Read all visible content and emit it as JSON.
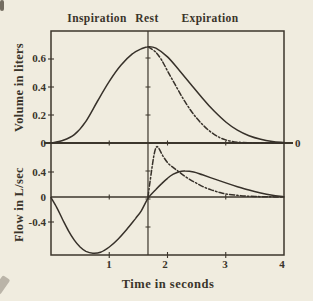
{
  "figure": {
    "phase_labels": [
      "Inspiration",
      "Rest",
      "Expiration"
    ],
    "volume_axis": {
      "label": "Volume in liters",
      "ticks": [
        "0.6",
        "0.4",
        "0.2",
        "0"
      ]
    },
    "flow_axis": {
      "label": "Flow in L/sec",
      "ticks": [
        "0.4",
        "0",
        "-0.4"
      ]
    },
    "right_zero_label": "0",
    "x_axis": {
      "label": "Time in seconds",
      "ticks": [
        "1",
        "2",
        "3",
        "4"
      ]
    }
  },
  "chart_data": [
    {
      "id": "volume",
      "type": "line",
      "ylabel": "Volume in liters",
      "xlabel": "Time in seconds",
      "xlim": [
        0,
        4
      ],
      "ylim": [
        0,
        0.8
      ],
      "ytick_values": [
        0,
        0.2,
        0.4,
        0.6
      ],
      "zero_line_tick_times": [
        1,
        2,
        3
      ],
      "annotations": [
        "Inspiration",
        "Rest",
        "Expiration"
      ],
      "rest_line_x": 1.665,
      "series": [
        {
          "name": "solid",
          "style": "solid",
          "points": [
            [
              0,
              0
            ],
            [
              0.2,
              0.018
            ],
            [
              0.4,
              0.06
            ],
            [
              0.6,
              0.155
            ],
            [
              0.8,
              0.3
            ],
            [
              1.0,
              0.44
            ],
            [
              1.2,
              0.555
            ],
            [
              1.4,
              0.638
            ],
            [
              1.55,
              0.672
            ],
            [
              1.665,
              0.688
            ],
            [
              1.8,
              0.678
            ],
            [
              2.0,
              0.615
            ],
            [
              2.2,
              0.52
            ],
            [
              2.4,
              0.42
            ],
            [
              2.6,
              0.32
            ],
            [
              2.8,
              0.228
            ],
            [
              3.0,
              0.15
            ],
            [
              3.2,
              0.092
            ],
            [
              3.4,
              0.052
            ],
            [
              3.6,
              0.027
            ],
            [
              3.8,
              0.011
            ],
            [
              4.0,
              0.003
            ]
          ]
        },
        {
          "name": "dashed",
          "style": "dashdot",
          "points": [
            [
              1.665,
              0.688
            ],
            [
              1.8,
              0.648
            ],
            [
              1.9,
              0.592
            ],
            [
              2.0,
              0.515
            ],
            [
              2.1,
              0.44
            ],
            [
              2.2,
              0.365
            ],
            [
              2.3,
              0.295
            ],
            [
              2.4,
              0.232
            ],
            [
              2.5,
              0.178
            ],
            [
              2.6,
              0.132
            ],
            [
              2.7,
              0.093
            ],
            [
              2.8,
              0.062
            ],
            [
              2.9,
              0.038
            ],
            [
              3.0,
              0.022
            ],
            [
              3.1,
              0.012
            ],
            [
              3.2,
              0.006
            ],
            [
              3.4,
              0.002
            ],
            [
              3.7,
              0.001
            ],
            [
              4.0,
              0.0
            ]
          ]
        }
      ]
    },
    {
      "id": "flow",
      "type": "line",
      "ylabel": "Flow in L/sec",
      "xlabel": "Time in seconds",
      "xlim": [
        0,
        4
      ],
      "ylim": [
        -0.93,
        0.86
      ],
      "ytick_values": [
        -0.4,
        0,
        0.4
      ],
      "zero_line_tick_times": [
        1,
        3
      ],
      "xtick_values": [
        1,
        2,
        3,
        4
      ],
      "rest_line_x": 1.665,
      "series": [
        {
          "name": "solid",
          "style": "solid",
          "points": [
            [
              0,
              -0.01
            ],
            [
              0.1,
              -0.17
            ],
            [
              0.2,
              -0.36
            ],
            [
              0.3,
              -0.54
            ],
            [
              0.4,
              -0.69
            ],
            [
              0.5,
              -0.8
            ],
            [
              0.6,
              -0.87
            ],
            [
              0.72,
              -0.9
            ],
            [
              0.85,
              -0.885
            ],
            [
              1.0,
              -0.8
            ],
            [
              1.15,
              -0.675
            ],
            [
              1.3,
              -0.52
            ],
            [
              1.45,
              -0.345
            ],
            [
              1.55,
              -0.22
            ],
            [
              1.665,
              -0.02
            ],
            [
              1.8,
              0.12
            ],
            [
              1.9,
              0.215
            ],
            [
              2.0,
              0.3
            ],
            [
              2.1,
              0.365
            ],
            [
              2.2,
              0.405
            ],
            [
              2.3,
              0.415
            ],
            [
              2.45,
              0.4
            ],
            [
              2.6,
              0.355
            ],
            [
              2.8,
              0.29
            ],
            [
              3.0,
              0.225
            ],
            [
              3.2,
              0.165
            ],
            [
              3.4,
              0.11
            ],
            [
              3.6,
              0.065
            ],
            [
              3.8,
              0.028
            ],
            [
              4.0,
              0.002
            ]
          ]
        },
        {
          "name": "dashed",
          "style": "dashdot",
          "points": [
            [
              1.665,
              0.0
            ],
            [
              1.72,
              0.38
            ],
            [
              1.77,
              0.68
            ],
            [
              1.81,
              0.8
            ],
            [
              1.85,
              0.78
            ],
            [
              1.92,
              0.66
            ],
            [
              2.0,
              0.55
            ],
            [
              2.1,
              0.47
            ],
            [
              2.2,
              0.4
            ],
            [
              2.3,
              0.33
            ],
            [
              2.4,
              0.27
            ],
            [
              2.5,
              0.22
            ],
            [
              2.6,
              0.17
            ],
            [
              2.7,
              0.13
            ],
            [
              2.8,
              0.1
            ],
            [
              2.9,
              0.07
            ],
            [
              3.0,
              0.05
            ],
            [
              3.15,
              0.032
            ],
            [
              3.3,
              0.018
            ],
            [
              3.5,
              0.008
            ],
            [
              3.75,
              0.003
            ],
            [
              4.0,
              0.0
            ]
          ]
        }
      ]
    }
  ],
  "colors": {
    "line": "#3c362c",
    "curve": "#37312a",
    "background": "#f0ecdf",
    "text": "#3a342a"
  }
}
